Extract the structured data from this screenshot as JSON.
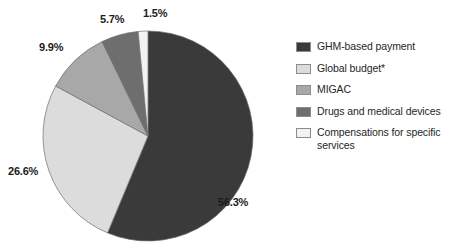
{
  "chart_data": {
    "type": "pie",
    "title": "",
    "subtitle": "",
    "xlabel": "",
    "ylabel": "",
    "legend_position": "right",
    "grid": false,
    "start_angle_deg": 0,
    "direction": "clockwise",
    "categories": [
      "GHM-based payment",
      "Global budget*",
      "MIGAC",
      "Drugs and medical devices",
      "Compensations for specific services"
    ],
    "values": [
      56.3,
      26.6,
      9.9,
      5.7,
      1.5
    ],
    "value_unit": "%",
    "data_labels": [
      "56.3%",
      "26.6%",
      "9.9%",
      "5.7%",
      "1.5%"
    ],
    "colors": [
      "#3a3a3a",
      "#dcdcdc",
      "#a8a8a8",
      "#6e6e6e",
      "#f2f2f2"
    ],
    "slices": [
      {
        "label": "GHM-based payment",
        "value": 56.3,
        "data_label": "56.3%",
        "color": "#3a3a3a"
      },
      {
        "label": "Global budget*",
        "value": 26.6,
        "data_label": "26.6%",
        "color": "#dcdcdc"
      },
      {
        "label": "MIGAC",
        "value": 9.9,
        "data_label": "9.9%",
        "color": "#a8a8a8"
      },
      {
        "label": "Drugs and medical devices",
        "value": 5.7,
        "data_label": "5.7%",
        "color": "#6e6e6e"
      },
      {
        "label": "Compensations for specific services",
        "value": 1.5,
        "data_label": "1.5%",
        "color": "#f2f2f2"
      }
    ]
  },
  "pie": {
    "labels": {
      "ghm": "56.3%",
      "global_budget": "26.6%",
      "migac": "9.9%",
      "drugs": "5.7%",
      "compensations": "1.5%"
    }
  },
  "legend": {
    "items": [
      {
        "label": "GHM-based payment",
        "color": "#3a3a3a"
      },
      {
        "label": "Global budget*",
        "color": "#dcdcdc"
      },
      {
        "label": "MIGAC",
        "color": "#a8a8a8"
      },
      {
        "label": "Drugs and medical devices",
        "color": "#6e6e6e"
      },
      {
        "label": "Compensations for specific services",
        "color": "#f2f2f2"
      }
    ]
  },
  "geometry": {
    "center_x": 148,
    "center_y": 136,
    "radius": 105
  }
}
